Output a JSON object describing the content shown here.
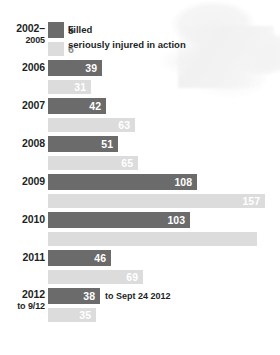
{
  "chart_data": {
    "type": "bar",
    "title": "",
    "subtitle": "",
    "xlabel": "",
    "ylabel": "",
    "orientation": "horizontal",
    "grid": false,
    "legend_position": "inline-first-row",
    "xlim": [
      0,
      170
    ],
    "categories": [
      "2002–2005",
      "2006",
      "2007",
      "2008",
      "2009",
      "2010",
      "2011",
      "2012"
    ],
    "series": [
      {
        "name": "killed",
        "color": "#6b6b6b",
        "values": [
          5,
          39,
          42,
          51,
          108,
          103,
          46,
          38
        ]
      },
      {
        "name": "seriously injured in action",
        "color": "#dcdcdc",
        "values": [
          6,
          31,
          63,
          65,
          157,
          151,
          69,
          35
        ]
      }
    ],
    "annotations": [
      "to Sept 24 2012"
    ]
  },
  "legend": {
    "killed_label": "killed",
    "injured_label": "seriously injured in action"
  },
  "rows": [
    {
      "year": "2002–",
      "year_sub": "2005",
      "killed": {
        "value": "5",
        "width_px": 16,
        "label_outside": true
      },
      "injured": {
        "value": "6",
        "width_px": 16,
        "label_outside": true
      },
      "killed_note": "killed",
      "injured_note": "seriously injured in action"
    },
    {
      "year": "2006",
      "year_sub": "",
      "killed": {
        "value": "39",
        "width_px": 54,
        "label_outside": false
      },
      "injured": {
        "value": "31",
        "width_px": 43,
        "label_outside": false
      }
    },
    {
      "year": "2007",
      "year_sub": "",
      "killed": {
        "value": "42",
        "width_px": 58,
        "label_outside": false
      },
      "injured": {
        "value": "63",
        "width_px": 87,
        "label_outside": false
      }
    },
    {
      "year": "2008",
      "year_sub": "",
      "killed": {
        "value": "51",
        "width_px": 70,
        "label_outside": false
      },
      "injured": {
        "value": "65",
        "width_px": 90,
        "label_outside": false
      }
    },
    {
      "year": "2009",
      "year_sub": "",
      "killed": {
        "value": "108",
        "width_px": 149,
        "label_outside": false
      },
      "injured": {
        "value": "157",
        "width_px": 217,
        "label_outside": false
      }
    },
    {
      "year": "2010",
      "year_sub": "",
      "killed": {
        "value": "103",
        "width_px": 142,
        "label_outside": false
      },
      "injured": {
        "value": "",
        "width_px": 209,
        "label_outside": false
      }
    },
    {
      "year": "2011",
      "year_sub": "",
      "killed": {
        "value": "46",
        "width_px": 63,
        "label_outside": false
      },
      "injured": {
        "value": "69",
        "width_px": 95,
        "label_outside": false
      }
    },
    {
      "year": "2012",
      "year_sub": "to 9/12",
      "killed": {
        "value": "38",
        "width_px": 52,
        "label_outside": false
      },
      "injured": {
        "value": "35",
        "width_px": 48,
        "label_outside": false
      },
      "killed_note": "to Sept 24 2012"
    }
  ],
  "colors": {
    "killed": "#6b6b6b",
    "injured": "#dcdcdc",
    "text": "#231f1f",
    "background": "#ffffff"
  }
}
